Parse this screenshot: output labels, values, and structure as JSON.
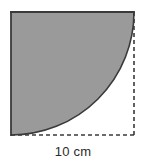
{
  "figure": {
    "kind": "geometry-diagram",
    "background_color": "#ffffff",
    "shaded_fill_color": "#9a9a9a",
    "outline_color": "#3a3a3a",
    "dashed_color": "#3a3a3a",
    "label_color": "#2b2b2b",
    "square": {
      "x": 11,
      "y": 12,
      "side": 123,
      "solid_edges": [
        "top",
        "left"
      ],
      "dashed_edges": [
        "right",
        "bottom"
      ]
    },
    "arc": {
      "center": "top-right",
      "radius": 123,
      "start_point": "top-right-corner",
      "end_point": "bottom-left-corner",
      "style": "solid"
    },
    "dimension": {
      "value": "10 cm",
      "measures": "square side length",
      "position": "below-bottom-edge"
    }
  }
}
